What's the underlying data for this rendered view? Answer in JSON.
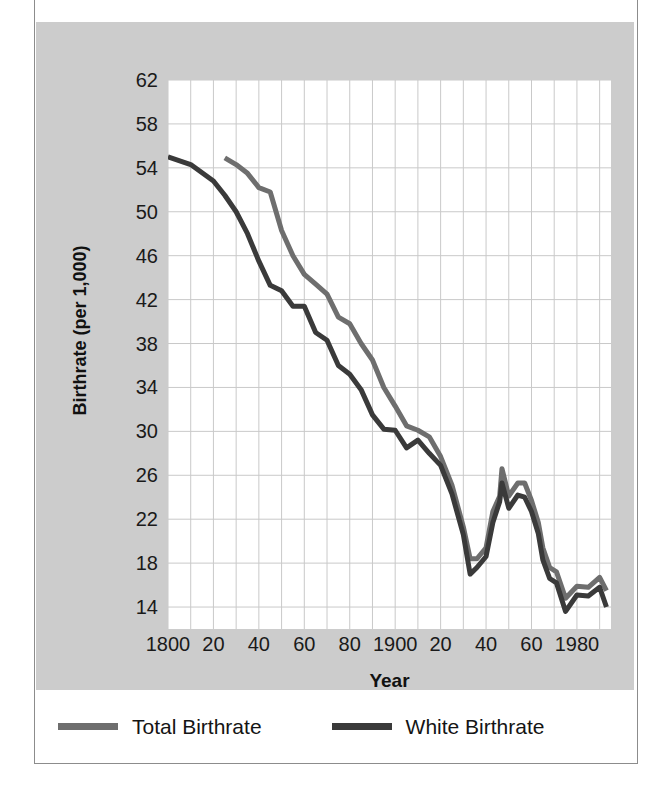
{
  "chart_data": {
    "type": "line",
    "title": "",
    "xlabel": "Year",
    "ylabel": "Birthrate (per 1,000)",
    "xlim": [
      1800,
      1995
    ],
    "ylim": [
      12,
      62
    ],
    "grid": true,
    "legend_position": "bottom",
    "y_ticks": [
      62,
      58,
      54,
      50,
      46,
      42,
      38,
      34,
      30,
      26,
      22,
      18,
      14
    ],
    "x_ticks": [
      {
        "value": 1800,
        "label": "1800"
      },
      {
        "value": 1820,
        "label": "20"
      },
      {
        "value": 1840,
        "label": "40"
      },
      {
        "value": 1860,
        "label": "60"
      },
      {
        "value": 1880,
        "label": "80"
      },
      {
        "value": 1900,
        "label": "1900"
      },
      {
        "value": 1920,
        "label": "20"
      },
      {
        "value": 1940,
        "label": "40"
      },
      {
        "value": 1960,
        "label": "60"
      },
      {
        "value": 1980,
        "label": "1980"
      }
    ],
    "x_minor_gridline_step": 10,
    "series": [
      {
        "name": "Total Birthrate",
        "color": "#6e6e6e",
        "x": [
          1825,
          1830,
          1835,
          1840,
          1845,
          1850,
          1855,
          1860,
          1865,
          1870,
          1875,
          1880,
          1885,
          1890,
          1895,
          1900,
          1905,
          1910,
          1915,
          1920,
          1925,
          1930,
          1933,
          1936,
          1940,
          1943,
          1946,
          1947,
          1950,
          1954,
          1957,
          1960,
          1963,
          1965,
          1968,
          1971,
          1975,
          1980,
          1985,
          1990,
          1993
        ],
        "values": [
          54.9,
          54.3,
          53.5,
          52.2,
          51.8,
          48.3,
          46.0,
          44.3,
          43.4,
          42.5,
          40.4,
          39.8,
          38.0,
          36.5,
          34.0,
          32.3,
          30.5,
          30.1,
          29.5,
          27.7,
          25.1,
          21.3,
          18.4,
          18.4,
          19.4,
          22.7,
          24.1,
          26.6,
          24.1,
          25.3,
          25.3,
          23.7,
          21.7,
          19.4,
          17.6,
          17.2,
          14.8,
          15.9,
          15.8,
          16.7,
          15.5
        ]
      },
      {
        "name": "White Birthrate",
        "color": "#3a3a3a",
        "x": [
          1800,
          1810,
          1820,
          1825,
          1830,
          1835,
          1840,
          1845,
          1850,
          1855,
          1860,
          1865,
          1870,
          1875,
          1880,
          1885,
          1890,
          1895,
          1900,
          1905,
          1910,
          1915,
          1920,
          1925,
          1930,
          1933,
          1936,
          1940,
          1943,
          1946,
          1947,
          1950,
          1954,
          1957,
          1960,
          1963,
          1965,
          1968,
          1971,
          1975,
          1980,
          1985,
          1990,
          1993
        ],
        "values": [
          55.0,
          54.3,
          52.8,
          51.5,
          50.0,
          48.0,
          45.5,
          43.3,
          42.8,
          41.4,
          41.4,
          39.0,
          38.3,
          36.0,
          35.2,
          33.8,
          31.5,
          30.2,
          30.1,
          28.5,
          29.2,
          28.0,
          26.9,
          24.3,
          20.6,
          17.0,
          17.6,
          18.6,
          21.7,
          23.6,
          25.3,
          23.0,
          24.2,
          24.0,
          22.7,
          20.7,
          18.3,
          16.6,
          16.2,
          13.6,
          15.1,
          15.0,
          15.8,
          14.0
        ]
      }
    ]
  },
  "axes": {
    "y_title": "Birthrate (per 1,000)",
    "x_title": "Year"
  },
  "legend": {
    "items": [
      {
        "label": "Total Birthrate",
        "color": "#6e6e6e"
      },
      {
        "label": "White Birthrate",
        "color": "#3a3a3a"
      }
    ]
  }
}
